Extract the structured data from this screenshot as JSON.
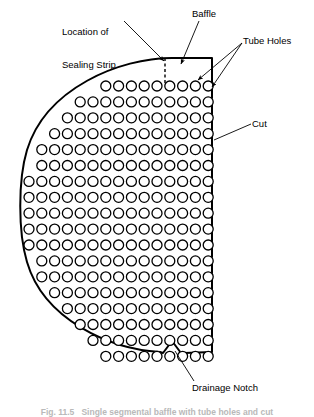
{
  "figure": {
    "type": "engineering-diagram",
    "caption": "Fig. 11.5   Single segmental baffle with tube holes and cut"
  },
  "annotations": {
    "sealing_strip": {
      "label": "Location of\nSealing Strip",
      "line1": "Location of",
      "line2": "Sealing Strip"
    },
    "baffle": {
      "label": "Baffle"
    },
    "tube_holes": {
      "label": "Tube Holes"
    },
    "cut": {
      "label": "Cut"
    },
    "drainage_notch": {
      "label": "Drainage Notch"
    }
  },
  "geometry": {
    "stroke_color": "#000000",
    "fill_color": "#ffffff",
    "outline_stroke_width": 2.0,
    "hole_stroke_width": 1.3,
    "leader_stroke_width": 0.9,
    "dash_pattern": "3,2.5",
    "baffle": {
      "cut_edge_x": 212,
      "arc_top_y": 58,
      "arc_bottom_y": 352,
      "arc_left_x": 22,
      "center_y": 205
    },
    "drainage_notch": {
      "apex_x": 172,
      "apex_y": 341,
      "left_x": 163,
      "right_x": 182,
      "base_y": 353
    },
    "sealing_strip_line": {
      "x": 165,
      "y_top": 58,
      "y_bottom": 82
    }
  },
  "tube_grid": {
    "hole_radius": 5.0,
    "col_pitch": 12.8,
    "row_pitch": 15.9,
    "first_col_x": 29,
    "first_row_y": 86,
    "rows": 18,
    "cols": 15,
    "row_spans": [
      [
        6,
        14
      ],
      [
        4,
        14
      ],
      [
        3,
        14
      ],
      [
        2,
        14
      ],
      [
        1,
        14
      ],
      [
        1,
        14
      ],
      [
        0,
        14
      ],
      [
        0,
        14
      ],
      [
        0,
        14
      ],
      [
        0,
        14
      ],
      [
        0,
        14
      ],
      [
        1,
        14
      ],
      [
        1,
        14
      ],
      [
        2,
        14
      ],
      [
        3,
        14
      ],
      [
        4,
        14
      ],
      [
        5,
        14
      ],
      [
        6,
        14
      ]
    ]
  },
  "leaders": {
    "sealing_strip": {
      "x1": 124,
      "y1": 22,
      "x2": 164,
      "y2": 60
    },
    "baffle": {
      "x1": 197,
      "y1": 22,
      "x2": 182,
      "y2": 63
    },
    "tube_holes_1": {
      "x1": 243,
      "y1": 42,
      "x2": 196,
      "y2": 80
    },
    "tube_holes_2": {
      "x1": 243,
      "y1": 42,
      "x2": 211,
      "y2": 86
    },
    "cut": {
      "x1": 251,
      "y1": 124,
      "x2": 213,
      "y2": 140
    },
    "drainage_notch": {
      "x1": 193,
      "y1": 382,
      "x2": 174,
      "y2": 350
    }
  }
}
